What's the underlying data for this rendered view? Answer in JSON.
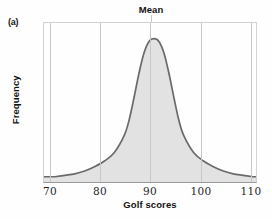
{
  "figure": {
    "panel_label": "(a)",
    "background_color": "#fefefe"
  },
  "chart_data": {
    "type": "area",
    "title": "Mean",
    "xlabel": "Golf scores",
    "ylabel": "Frequency",
    "xlim": [
      67.6,
      110.8
    ],
    "ylim": [
      0,
      1.06
    ],
    "grid": "vertical-only",
    "legend": null,
    "xticks": [
      70,
      80,
      90,
      100,
      110
    ],
    "xtick_labels": [
      "70",
      "80",
      "90",
      "100",
      "110"
    ],
    "yticks": [],
    "ytick_labels": [],
    "annotations": [
      {
        "text": "Mean",
        "x": 90,
        "note": "title placed directly above the vertical gridline marking the mean of the distribution"
      }
    ],
    "series": [
      {
        "name": "Golf score frequency",
        "fill_color": "#e2e2e2",
        "line_color": "#6a6a6a",
        "x": [
          70,
          72,
          74,
          76,
          78,
          80,
          82,
          84,
          85,
          86,
          87,
          88,
          89,
          90,
          91,
          92,
          93,
          94,
          95,
          96,
          98,
          100,
          102,
          104,
          106,
          108,
          110
        ],
        "y": [
          0.03,
          0.04,
          0.05,
          0.07,
          0.1,
          0.14,
          0.2,
          0.32,
          0.43,
          0.59,
          0.76,
          0.9,
          0.98,
          1.0,
          0.98,
          0.9,
          0.76,
          0.59,
          0.43,
          0.32,
          0.2,
          0.14,
          0.1,
          0.07,
          0.05,
          0.04,
          0.03
        ]
      }
    ]
  },
  "axis_titles": {
    "x": "Golf scores",
    "y": "Frequency"
  }
}
